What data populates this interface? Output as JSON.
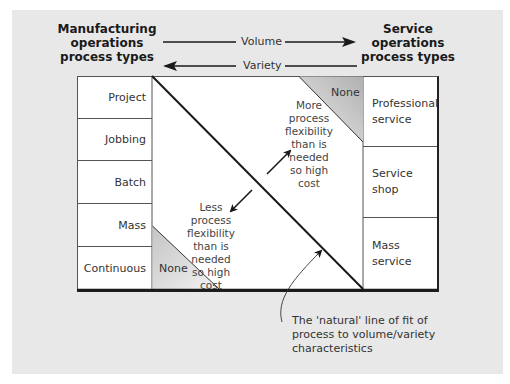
{
  "header": {
    "left_title_lines": [
      "Manufacturing",
      "operations",
      "process types"
    ],
    "right_title_lines": [
      "Service",
      "operations",
      "process types"
    ],
    "volume_label": "Volume",
    "variety_label": "Variety"
  },
  "manufacturing_types": [
    "Project",
    "Jobbing",
    "Batch",
    "Mass",
    "Continuous"
  ],
  "service_types": [
    {
      "lines": [
        "Professional",
        "service"
      ]
    },
    {
      "lines": [
        "Service",
        "shop"
      ]
    },
    {
      "lines": [
        "Mass",
        "service"
      ]
    }
  ],
  "regions": {
    "top_right_none": "None",
    "bottom_left_none": "None",
    "upper_note_lines": [
      "More",
      "process",
      "flexibility",
      "than is",
      "needed",
      "so high",
      "cost"
    ],
    "lower_note_lines": [
      "Less",
      "process",
      "flexibility",
      "than is",
      "needed",
      "so high",
      "cost"
    ]
  },
  "caption_lines": [
    "The 'natural' line of fit of",
    "process to volume/variety",
    "characteristics"
  ],
  "colors": {
    "panel_bg": "#e8e8e8",
    "cell_bg": "#ffffff",
    "line": "#1a1a1a",
    "none_shade_dark": "#b8b8b8",
    "none_shade_light": "#eeeeee"
  }
}
